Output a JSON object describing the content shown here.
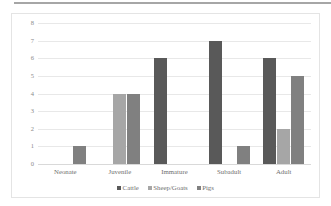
{
  "chart_data": {
    "type": "bar",
    "title": "",
    "subtitle": "",
    "xlabel": "",
    "ylabel": "",
    "categories": [
      "Neonate",
      "Juvenile",
      "Immature",
      "Subadult",
      "Adult"
    ],
    "series": [
      {
        "name": "Cattle",
        "color": "#595959",
        "values": [
          0,
          0,
          6,
          7,
          6
        ]
      },
      {
        "name": "Sheep/Goats",
        "color": "#a6a6a6",
        "values": [
          0,
          4,
          0,
          0,
          2
        ]
      },
      {
        "name": "Pigs",
        "color": "#808080",
        "values": [
          1,
          4,
          0,
          1,
          5
        ]
      }
    ],
    "ylim": [
      0,
      8
    ],
    "yticks": [
      8,
      7,
      6,
      5,
      4,
      3,
      2,
      1,
      0
    ],
    "grid": true,
    "grid_axis": "y",
    "legend": true,
    "legend_position": "bottom",
    "legend_marker": "square"
  },
  "colors": {
    "cattle": "#595959",
    "sheep_goats": "#a6a6a6",
    "pigs": "#808080",
    "gridline": "#e8e8e8",
    "frame": "#e4e4e4",
    "tick_text": "#8a8a8a",
    "label_text": "#6f6f6f",
    "top_rule": "#a6a6a6",
    "background": "#ffffff"
  }
}
